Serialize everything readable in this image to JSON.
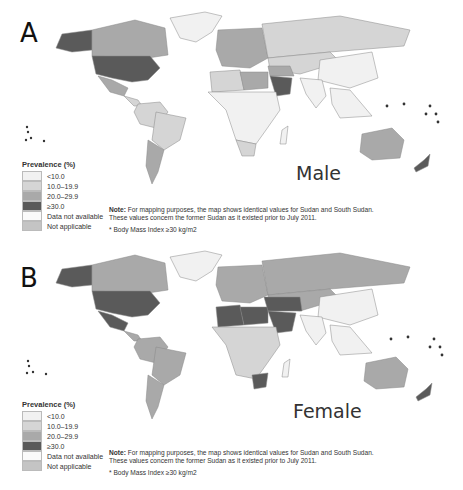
{
  "figure": {
    "panels": [
      {
        "id": "A",
        "panel_label": "A",
        "sex_label": "Male",
        "legend": {
          "title": "Prevalence (%)",
          "items": [
            {
              "label": "<10.0",
              "color": "#f1f1f1"
            },
            {
              "label": "10.0–19.9",
              "color": "#d5d5d5"
            },
            {
              "label": "20.0–29.9",
              "color": "#a9a9a9"
            },
            {
              "label": "≥30.0",
              "color": "#5a5a5a"
            },
            {
              "label": "Data not available",
              "color": "#fafafa"
            },
            {
              "label": "Not applicable",
              "color": "#c4c4c4"
            }
          ]
        },
        "note_bold": "Note:",
        "note_line1": " For mapping purposes, the map shows identical values for Sudan and South Sudan.",
        "note_line2": "These values concern the former Sudan as it existed prior to July 2011.",
        "footnote": "* Body Mass Index ≥30 kg/m2"
      },
      {
        "id": "B",
        "panel_label": "B",
        "sex_label": "Female",
        "legend": {
          "title": "Prevalence (%)",
          "items": [
            {
              "label": "<10.0",
              "color": "#f1f1f1"
            },
            {
              "label": "10.0–19.9",
              "color": "#d5d5d5"
            },
            {
              "label": "20.0–29.9",
              "color": "#a9a9a9"
            },
            {
              "label": "≥30.0",
              "color": "#5a5a5a"
            },
            {
              "label": "Data not available",
              "color": "#fafafa"
            },
            {
              "label": "Not applicable",
              "color": "#c4c4c4"
            }
          ]
        },
        "note_bold": "Note:",
        "note_line1": " For mapping purposes, the map shows identical values for Sudan and South Sudan.",
        "note_line2": "These values concern the former Sudan as it existed prior to July 2011.",
        "footnote": "* Body Mass Index ≥30 kg/m2"
      }
    ]
  },
  "map_fills": {
    "male": {
      "alaska": "#5a5a5a",
      "canada": "#a9a9a9",
      "usa": "#5a5a5a",
      "mexico": "#a9a9a9",
      "central_america": "#d5d5d5",
      "greenland": "#f1f1f1",
      "south_america_north": "#d5d5d5",
      "brazil": "#d5d5d5",
      "argentina": "#a9a9a9",
      "europe": "#a9a9a9",
      "russia": "#d5d5d5",
      "central_asia": "#d5d5d5",
      "china": "#f1f1f1",
      "india": "#f1f1f1",
      "southeast_asia": "#f1f1f1",
      "north_africa": "#d5d5d5",
      "egypt_libya": "#a9a9a9",
      "saudi_arabia": "#5a5a5a",
      "middle_east": "#a9a9a9",
      "subsaharan_africa": "#f1f1f1",
      "south_africa": "#d5d5d5",
      "australia": "#a9a9a9",
      "new_zealand": "#5a5a5a"
    },
    "female": {
      "alaska": "#5a5a5a",
      "canada": "#a9a9a9",
      "usa": "#5a5a5a",
      "mexico": "#5a5a5a",
      "central_america": "#a9a9a9",
      "greenland": "#f1f1f1",
      "south_america_north": "#a9a9a9",
      "brazil": "#a9a9a9",
      "argentina": "#a9a9a9",
      "europe": "#a9a9a9",
      "russia": "#a9a9a9",
      "central_asia": "#a9a9a9",
      "china": "#f1f1f1",
      "india": "#f1f1f1",
      "southeast_asia": "#f1f1f1",
      "north_africa": "#5a5a5a",
      "egypt_libya": "#5a5a5a",
      "saudi_arabia": "#5a5a5a",
      "middle_east": "#5a5a5a",
      "subsaharan_africa": "#d5d5d5",
      "south_africa": "#5a5a5a",
      "australia": "#a9a9a9",
      "new_zealand": "#5a5a5a"
    }
  }
}
